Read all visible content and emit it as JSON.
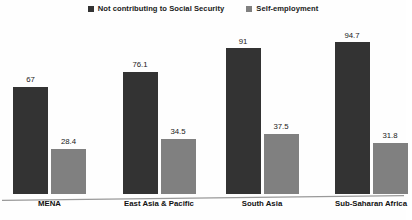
{
  "chart_data": {
    "type": "bar",
    "title": "",
    "subtitle": "",
    "xlabel": "",
    "ylabel": "",
    "ylim": [
      0,
      100
    ],
    "grid": false,
    "legend_position": "top-center",
    "axis": {
      "y_axis_visible": false,
      "x_axis_visible": true,
      "tick_labels_visible": false
    },
    "categories": [
      "MENA",
      "East Asia & Pacific",
      "South Asia",
      "Sub-Saharan Africa"
    ],
    "series": [
      {
        "name": "Not contributing to Social Security",
        "color": "#333333",
        "values": [
          67,
          76.1,
          91,
          94.7
        ],
        "labels": [
          "67",
          "76.1",
          "91",
          "94.7"
        ]
      },
      {
        "name": "Self-employment",
        "color": "#808080",
        "values": [
          28.4,
          34.5,
          37.5,
          31.8
        ],
        "labels": [
          "28.4",
          "34.5",
          "37.5",
          "31.8"
        ]
      }
    ]
  },
  "legend": {
    "items": [
      {
        "label": "Not contributing to Social Security",
        "color": "#333333",
        "marker": "square-marker"
      },
      {
        "label": "Self-employment",
        "color": "#808080",
        "marker": "square-marker"
      }
    ]
  },
  "colors": {
    "series_dark": "#333333",
    "series_gray": "#808080",
    "axis_line": "#999999",
    "background": "#fefefe",
    "text": "#111111"
  }
}
